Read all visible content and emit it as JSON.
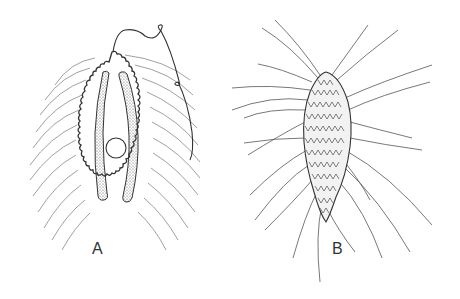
{
  "figure": {
    "panels": [
      {
        "id": "A",
        "label": "A",
        "description": "Oval ciliated organism with two elongated stippled bodies, central round nucleus, scalloped outline and a long trailing flagellum"
      },
      {
        "id": "B",
        "label": "B",
        "description": "Spindle-shaped organism covered with overlapping scales and radiating long bristles"
      }
    ],
    "colors": {
      "line": "#333333",
      "background": "#ffffff",
      "stipple": "#555555"
    }
  }
}
